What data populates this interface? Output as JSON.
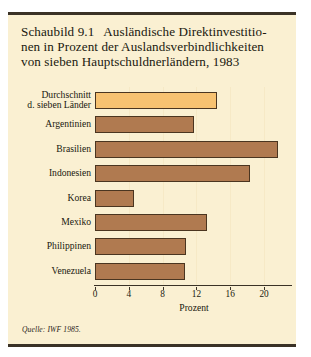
{
  "figure": {
    "number": "Schaubild 9.1",
    "title_lines": [
      "Ausländische Direktinvestitio-",
      "nen in Prozent der Auslandsverbindlichkeiten",
      "von sieben Hauptschuldnerländern, 1983"
    ],
    "source": "Quelle: IWF 1985."
  },
  "colors": {
    "background": "#faf0d2",
    "frame_rule": "#3a3226",
    "bar_brown": "#b07a50",
    "bar_orange": "#f7c271",
    "bar_outline": "#4a3520",
    "text": "#20180f",
    "gridline": "#f6e9c6"
  },
  "chart_data": {
    "type": "bar",
    "orientation": "horizontal",
    "xlabel": "Prozent",
    "ylabel": "",
    "xlim": [
      0,
      23.3
    ],
    "xticks": [
      0,
      4,
      8,
      12,
      16,
      20
    ],
    "xticklabels": [
      "0",
      "4",
      "8",
      "12",
      "16",
      "20"
    ],
    "grid": "vertical-faint",
    "legend": "none",
    "categories": [
      "Durchschnitt d. sieben Länder",
      "Argentinien",
      "Brasilien",
      "Indonesien",
      "Korea",
      "Mexiko",
      "Philippinen",
      "Venezuela"
    ],
    "category_labels": [
      {
        "line1": "Durchschnitt",
        "line2": "d. sieben Länder"
      },
      {
        "line1": "Argentinien",
        "line2": ""
      },
      {
        "line1": "Brasilien",
        "line2": ""
      },
      {
        "line1": "Indonesien",
        "line2": ""
      },
      {
        "line1": "Korea",
        "line2": ""
      },
      {
        "line1": "Mexiko",
        "line2": ""
      },
      {
        "line1": "Philippinen",
        "line2": ""
      },
      {
        "line1": "Venezuela",
        "line2": ""
      }
    ],
    "values": [
      14.4,
      11.7,
      21.6,
      18.3,
      4.6,
      13.3,
      10.8,
      10.7
    ],
    "bar_colors": [
      "#f7c271",
      "#b07a50",
      "#b07a50",
      "#b07a50",
      "#b07a50",
      "#b07a50",
      "#b07a50",
      "#b07a50"
    ]
  }
}
